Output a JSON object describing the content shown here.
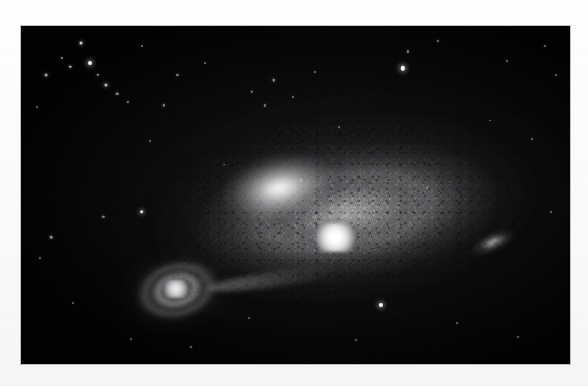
{
  "page": {
    "background_color": "#fdfdfd",
    "type": "astronomical-photographic-plate",
    "caption": ""
  },
  "plate": {
    "label": "galaxy-field-photograph",
    "background_color": "#020203",
    "left": 21,
    "top": 26,
    "width": 549,
    "height": 338,
    "border_color": "#78787d"
  },
  "objects": {
    "main_galaxy": {
      "name": "main-spiral-galaxy",
      "core_color": "#ffffff",
      "halo_color": "#8e8e92",
      "core_x_pct": 57.2,
      "core_y_pct": 62.5,
      "tilt_deg": -8
    },
    "companion_galaxy": {
      "name": "companion-spiral-galaxy",
      "core_color": "#f2f2f3",
      "halo_color": "#88888c",
      "core_x_pct": 28.2,
      "core_y_pct": 77.8,
      "tilt_deg": -14
    },
    "tidal_bridge": {
      "name": "tidal-bridge",
      "color": "#aaaaad"
    },
    "right_knot": {
      "name": "right-edge-knot",
      "color": "#e0e0e2",
      "x_pct": 86,
      "y_pct": 64
    }
  },
  "stars": [
    {
      "x": 11.0,
      "y": 5.0,
      "r": 1.5,
      "b": 0.8
    },
    {
      "x": 7.5,
      "y": 9.5,
      "r": 1.1,
      "b": 0.55
    },
    {
      "x": 9.0,
      "y": 12.0,
      "r": 1.3,
      "b": 0.62
    },
    {
      "x": 12.5,
      "y": 11.0,
      "r": 2.0,
      "b": 0.95
    },
    {
      "x": 14.0,
      "y": 14.5,
      "r": 1.2,
      "b": 0.58
    },
    {
      "x": 15.5,
      "y": 17.5,
      "r": 1.6,
      "b": 0.72
    },
    {
      "x": 17.5,
      "y": 20.0,
      "r": 1.3,
      "b": 0.6
    },
    {
      "x": 19.5,
      "y": 22.5,
      "r": 1.1,
      "b": 0.5
    },
    {
      "x": 4.5,
      "y": 14.5,
      "r": 1.4,
      "b": 0.6
    },
    {
      "x": 3.0,
      "y": 24.0,
      "r": 1.0,
      "b": 0.42
    },
    {
      "x": 22.0,
      "y": 6.0,
      "r": 0.9,
      "b": 0.4
    },
    {
      "x": 28.5,
      "y": 14.5,
      "r": 1.1,
      "b": 0.48
    },
    {
      "x": 26.0,
      "y": 23.5,
      "r": 1.2,
      "b": 0.5
    },
    {
      "x": 33.5,
      "y": 11.0,
      "r": 0.9,
      "b": 0.38
    },
    {
      "x": 42.0,
      "y": 19.5,
      "r": 1.2,
      "b": 0.52
    },
    {
      "x": 46.0,
      "y": 16.0,
      "r": 1.3,
      "b": 0.56
    },
    {
      "x": 44.5,
      "y": 23.5,
      "r": 1.1,
      "b": 0.45
    },
    {
      "x": 49.5,
      "y": 21.0,
      "r": 1.0,
      "b": 0.42
    },
    {
      "x": 53.5,
      "y": 13.5,
      "r": 1.0,
      "b": 0.44
    },
    {
      "x": 70.5,
      "y": 7.5,
      "r": 1.1,
      "b": 0.48
    },
    {
      "x": 69.5,
      "y": 12.5,
      "r": 2.2,
      "b": 1.0
    },
    {
      "x": 76.0,
      "y": 4.5,
      "r": 1.1,
      "b": 0.46
    },
    {
      "x": 88.5,
      "y": 10.5,
      "r": 1.0,
      "b": 0.42
    },
    {
      "x": 95.5,
      "y": 6.0,
      "r": 1.1,
      "b": 0.45
    },
    {
      "x": 97.5,
      "y": 14.5,
      "r": 0.9,
      "b": 0.38
    },
    {
      "x": 23.5,
      "y": 34.0,
      "r": 1.0,
      "b": 0.42
    },
    {
      "x": 22.0,
      "y": 55.0,
      "r": 1.8,
      "b": 0.88
    },
    {
      "x": 15.0,
      "y": 56.5,
      "r": 1.2,
      "b": 0.5
    },
    {
      "x": 5.5,
      "y": 62.5,
      "r": 1.3,
      "b": 0.52
    },
    {
      "x": 3.5,
      "y": 68.5,
      "r": 1.1,
      "b": 0.44
    },
    {
      "x": 9.5,
      "y": 82.0,
      "r": 1.0,
      "b": 0.4
    },
    {
      "x": 20.0,
      "y": 92.5,
      "r": 1.0,
      "b": 0.38
    },
    {
      "x": 31.0,
      "y": 95.0,
      "r": 1.1,
      "b": 0.42
    },
    {
      "x": 65.5,
      "y": 82.5,
      "r": 2.1,
      "b": 0.96
    },
    {
      "x": 61.0,
      "y": 93.0,
      "r": 1.0,
      "b": 0.4
    },
    {
      "x": 79.5,
      "y": 88.0,
      "r": 0.9,
      "b": 0.36
    },
    {
      "x": 90.5,
      "y": 92.0,
      "r": 1.0,
      "b": 0.38
    },
    {
      "x": 96.5,
      "y": 55.0,
      "r": 1.0,
      "b": 0.4
    },
    {
      "x": 93.0,
      "y": 33.5,
      "r": 1.0,
      "b": 0.42
    },
    {
      "x": 85.5,
      "y": 28.0,
      "r": 0.9,
      "b": 0.36
    },
    {
      "x": 58.0,
      "y": 30.0,
      "r": 1.0,
      "b": 0.4
    },
    {
      "x": 37.0,
      "y": 41.0,
      "r": 0.9,
      "b": 0.36
    },
    {
      "x": 51.0,
      "y": 45.5,
      "r": 0.9,
      "b": 0.34
    },
    {
      "x": 74.0,
      "y": 48.0,
      "r": 0.9,
      "b": 0.34
    },
    {
      "x": 41.5,
      "y": 86.5,
      "r": 1.0,
      "b": 0.38
    }
  ]
}
